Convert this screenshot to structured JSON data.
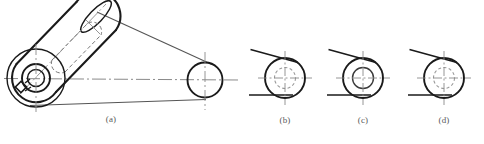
{
  "figure": {
    "kind": "engineering-drawing",
    "background_color": "#ffffff",
    "line_color": "#1a1a1a",
    "thin_line_color": "#555555",
    "center_line_color": "#8a8a8a",
    "hidden_line_color": "#777777",
    "label_color": "#5a5a5a"
  },
  "labels": [
    {
      "id": "a",
      "text": "(a)",
      "x": 111,
      "y": 116
    },
    {
      "id": "b",
      "text": "(b)",
      "x": 285,
      "y": 117
    },
    {
      "id": "c",
      "text": "(c)",
      "x": 363,
      "y": 117
    },
    {
      "id": "d",
      "text": "(d)",
      "x": 444,
      "y": 117
    }
  ],
  "main_view": {
    "name": "pictorial-crank-arm",
    "large_boss": {
      "cx": 36,
      "cy": 78,
      "outer_r": 29,
      "mid_r": 14,
      "bore_r": 8.5
    },
    "small_boss": {
      "cx": 205,
      "cy": 80,
      "outer_r": 17.5
    },
    "keyway": {
      "cx": 22,
      "cy": 88,
      "size": 7,
      "angle": -45
    },
    "barrel": {
      "axis_from_x": 36,
      "axis_from_y": 78,
      "axis_to_x": 96,
      "axis_to_y": 16,
      "half_width": 21
    },
    "hidden_slot": {
      "from_x": 60,
      "from_y": 56,
      "to_x": 92,
      "to_y": 22,
      "half_width": 9
    },
    "center_line_horizontal": {
      "x1": 4,
      "y1": 78,
      "x2": 238,
      "y2": 80
    },
    "center_line_vertical_large": {
      "x1": 36,
      "y1": 46,
      "x2": 36,
      "y2": 112
    },
    "center_line_vertical_small": {
      "x1": 205,
      "y1": 52,
      "x2": 205,
      "y2": 110
    },
    "tangent_upper": {
      "x1": 96,
      "y1": 12,
      "x2": 212,
      "y2": 64
    },
    "tangent_lower": {
      "x1": 30,
      "y1": 105,
      "x2": 206,
      "y2": 99
    },
    "axis_line": {
      "x1": 22,
      "y1": 92,
      "x2": 104,
      "y2": 6
    }
  },
  "detail_views": [
    {
      "id": "b",
      "name": "detail-b",
      "cx": 285,
      "cy": 78,
      "outer_r": 20,
      "inner_r": 10.5,
      "inner_style": "dashed",
      "tangent_upper": {
        "x1": 251,
        "y1": 50,
        "x2": 297,
        "y2": 62
      },
      "tangent_lower": {
        "x1": 249,
        "y1": 95,
        "x2": 292,
        "y2": 95
      },
      "center_h": {
        "x1": 258,
        "y1": 78,
        "x2": 312,
        "y2": 78
      },
      "center_v": {
        "x1": 285,
        "y1": 51,
        "x2": 285,
        "y2": 105
      }
    },
    {
      "id": "c",
      "name": "detail-c",
      "cx": 363,
      "cy": 78,
      "outer_r": 20,
      "inner_r": 10.5,
      "inner_style": "solid",
      "tangent_upper": {
        "x1": 329,
        "y1": 50,
        "x2": 375,
        "y2": 62
      },
      "tangent_lower": {
        "x1": 327,
        "y1": 95,
        "x2": 370,
        "y2": 95
      },
      "center_h": {
        "x1": 336,
        "y1": 78,
        "x2": 390,
        "y2": 78
      },
      "center_v": {
        "x1": 363,
        "y1": 51,
        "x2": 363,
        "y2": 105
      }
    },
    {
      "id": "d",
      "name": "detail-d",
      "cx": 444,
      "cy": 78,
      "outer_r": 20,
      "inner_r": 10.5,
      "inner_style": "dashed",
      "tangent_upper": {
        "x1": 410,
        "y1": 50,
        "x2": 456,
        "y2": 62
      },
      "tangent_lower": {
        "x1": 408,
        "y1": 95,
        "x2": 451,
        "y2": 95
      },
      "center_h": {
        "x1": 417,
        "y1": 78,
        "x2": 471,
        "y2": 78
      },
      "center_v": {
        "x1": 444,
        "y1": 51,
        "x2": 444,
        "y2": 105
      }
    }
  ]
}
